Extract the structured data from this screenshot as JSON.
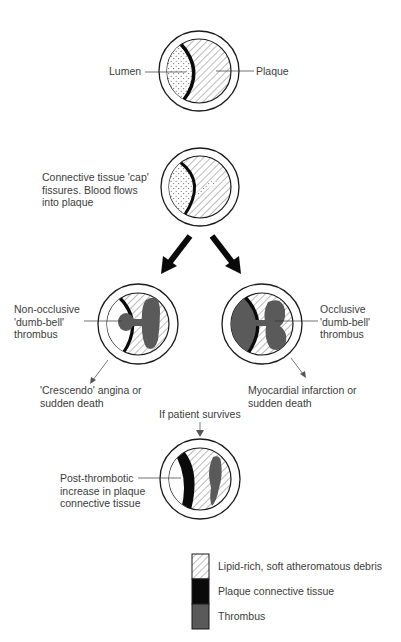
{
  "figure": {
    "stage1": {
      "labels": {
        "lumen": "Lumen",
        "plaque": "Plaque"
      }
    },
    "stage2": {
      "caption_lines": [
        "Connective tissue 'cap'",
        "fissures. Blood flows",
        "into plaque"
      ]
    },
    "stage3_left": {
      "label_lines": [
        "Non-occlusive",
        "'dumb-bell'",
        "thrombus"
      ],
      "outcome_lines": [
        "'Crescendo' angina or",
        "sudden death"
      ]
    },
    "stage3_right": {
      "label_lines": [
        "Occlusive",
        "'dumb-bell'",
        "thrombus"
      ],
      "outcome_lines": [
        "Myocardial infarction or",
        "sudden death"
      ]
    },
    "transition": {
      "label": "If patient survives"
    },
    "stage4": {
      "label_lines": [
        "Post-thrombotic",
        "increase in plaque",
        "connective tissue"
      ]
    }
  },
  "legend": {
    "items": [
      {
        "label": "Lipid-rich, soft atheromatous debris",
        "swatch": "hatched"
      },
      {
        "label": "Plaque connective tissue",
        "swatch": "#0a0a0a"
      },
      {
        "label": "Thrombus",
        "swatch": "#5a5a5a"
      }
    ]
  },
  "colors": {
    "outline": "#1a1a1a",
    "connective_tissue": "#0a0a0a",
    "thrombus": "#5a5a5a",
    "hatch": "#3a3a3a",
    "stipple": "#555555"
  }
}
